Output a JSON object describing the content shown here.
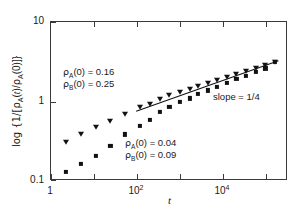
{
  "figure": {
    "background_color": "#ffffff",
    "frame_color": "#3a3a3a",
    "marker_color": "#111111"
  },
  "chart_data": {
    "type": "scatter",
    "title": "",
    "xlabel": "t",
    "ylabel": "log {1/[ρA(t)/ρA(0)]}",
    "xscale": "log",
    "yscale": "log",
    "xlim": [
      1,
      316227
    ],
    "ylim": [
      0.07,
      10
    ],
    "grid": false,
    "legend_position": "none",
    "x_tick_labels": [
      "1",
      "10^2",
      "10^4"
    ],
    "x_tick_values": [
      1,
      100,
      10000
    ],
    "y_tick_labels": [
      "0.1",
      "1",
      "10"
    ],
    "y_tick_values": [
      0.1,
      1,
      10
    ],
    "series": [
      {
        "name": "rho_A(0) = 0.16, rho_B(0) = 0.25",
        "marker": "triangle-down",
        "x": [
          2.2,
          5.0,
          11.0,
          24.0,
          52.0,
          115.0,
          200.0,
          330.0,
          560.0,
          1000.0,
          1700.0,
          2600.0,
          4300.0,
          7000.0,
          12000.0,
          20000.0,
          33000.0,
          56000.0,
          95000.0,
          160000.0
        ],
        "y": [
          0.24,
          0.3,
          0.38,
          0.46,
          0.56,
          0.7,
          0.77,
          0.9,
          1.02,
          1.13,
          1.25,
          1.35,
          1.5,
          1.62,
          1.78,
          1.95,
          2.15,
          2.4,
          2.65,
          2.9
        ]
      },
      {
        "name": "rho_A(0) = 0.04, rho_B(0) = 0.09",
        "marker": "square",
        "x": [
          2.2,
          5.0,
          11.0,
          24.0,
          52.0,
          115.0,
          200.0,
          330.0,
          560.0,
          1000.0,
          1700.0,
          2600.0,
          4300.0,
          7000.0,
          12000.0,
          20000.0,
          33000.0,
          56000.0,
          95000.0,
          160000.0
        ],
        "y": [
          0.092,
          0.118,
          0.155,
          0.21,
          0.3,
          0.39,
          0.47,
          0.6,
          0.7,
          0.83,
          0.92,
          1.05,
          1.18,
          1.32,
          1.5,
          1.68,
          1.88,
          2.1,
          2.35,
          2.85
        ]
      }
    ],
    "fit_line": {
      "label": "slope = 1/4",
      "slope": 0.25,
      "x_start": 100,
      "x_end": 200000,
      "y_start": 0.6,
      "y_end": 2.9
    },
    "annotations": [
      {
        "name": "upper-density-annotation",
        "lines": [
          "ρA(0) = 0.16",
          "ρB(0) = 0.25"
        ],
        "line1_symbol": "ρ",
        "line1_sub": "A",
        "line1_rest": "(0) = 0.16",
        "line2_symbol": "ρ",
        "line2_sub": "B",
        "line2_rest": "(0) = 0.25"
      },
      {
        "name": "lower-density-annotation",
        "lines": [
          "ρA(0) = 0.04",
          "ρB(0) = 0.09"
        ],
        "line1_symbol": "ρ",
        "line1_sub": "A",
        "line1_rest": "(0) = 0.04",
        "line2_symbol": "ρ",
        "line2_sub": "B",
        "line2_rest": "(0) = 0.09"
      }
    ]
  },
  "axes": {
    "x_title": "t",
    "y_title_prefix": "log {1/[",
    "y_title_rho": "ρ",
    "y_title_sub1": "A",
    "y_title_mid1": "(",
    "y_title_t": "t",
    "y_title_mid2": ")/",
    "y_title_rho2": "ρ",
    "y_title_sub2": "A",
    "y_title_suffix": "(0)]}"
  },
  "labels": {
    "x_tick_1": "1",
    "x_tick_2_base": "10",
    "x_tick_2_exp": "2",
    "x_tick_3_base": "10",
    "x_tick_3_exp": "4",
    "y_tick_low": "0.1",
    "y_tick_mid": "1",
    "y_tick_high": "10",
    "slope_label": "slope = 1/4",
    "annot_upper_l1_rho": "ρ",
    "annot_upper_l1_sub": "A",
    "annot_upper_l1_rest": "(0) = 0.16",
    "annot_upper_l2_rho": "ρ",
    "annot_upper_l2_sub": "B",
    "annot_upper_l2_rest": "(0) = 0.25",
    "annot_lower_l1_rho": "ρ",
    "annot_lower_l1_sub": "A",
    "annot_lower_l1_rest": "(0) = 0.04",
    "annot_lower_l2_rho": "ρ",
    "annot_lower_l2_sub": "B",
    "annot_lower_l2_rest": "(0) = 0.09"
  }
}
